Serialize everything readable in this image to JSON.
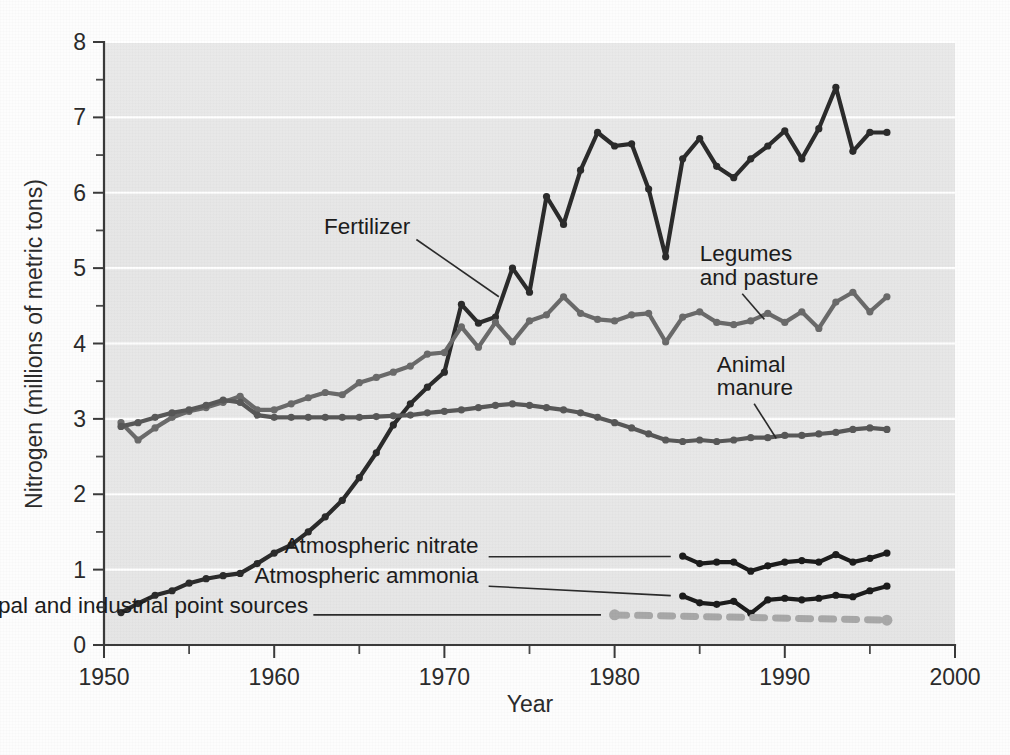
{
  "figure": {
    "background_color": "#fdfdfd",
    "plot_background_color": "#e7e7e7",
    "gridline_color": "#ffffff",
    "axis_color": "#3a3a3a"
  },
  "chart_data": {
    "type": "line",
    "title": "",
    "xlabel": "Year",
    "ylabel": "Nitrogen (millions of metric tons)",
    "xlim": [
      1950,
      2000
    ],
    "ylim": [
      0,
      8
    ],
    "x_major_ticks": [
      1950,
      1960,
      1970,
      1980,
      1990,
      2000
    ],
    "x_major_tick_labels": [
      "1950",
      "1960",
      "1970",
      "1980",
      "1990",
      "2000"
    ],
    "x_minor_ticks": [
      1955,
      1965,
      1975,
      1985,
      1995
    ],
    "y_major_ticks": [
      0,
      1,
      2,
      3,
      4,
      5,
      6,
      7,
      8
    ],
    "y_major_tick_labels": [
      "0",
      "1",
      "2",
      "3",
      "4",
      "5",
      "6",
      "7",
      "8"
    ],
    "y_minor_ticks": [
      0.5,
      1.5,
      2.5,
      3.5,
      4.5,
      5.5,
      6.5,
      7.5
    ],
    "grid": "horizontal-major-white",
    "legend_position": "inline-annotations",
    "series": [
      {
        "name": "Fertilizer",
        "color": "#2b2b2b",
        "style": "solid",
        "marker": "circle",
        "x": [
          1951,
          1952,
          1953,
          1954,
          1955,
          1956,
          1957,
          1958,
          1959,
          1960,
          1961,
          1962,
          1963,
          1964,
          1965,
          1966,
          1967,
          1968,
          1969,
          1970,
          1971,
          1972,
          1973,
          1974,
          1975,
          1976,
          1977,
          1978,
          1979,
          1980,
          1981,
          1982,
          1983,
          1984,
          1985,
          1986,
          1987,
          1988,
          1989,
          1990,
          1991,
          1992,
          1993,
          1994,
          1995,
          1996
        ],
        "values": [
          0.43,
          0.55,
          0.66,
          0.72,
          0.82,
          0.88,
          0.92,
          0.95,
          1.08,
          1.22,
          1.33,
          1.5,
          1.7,
          1.92,
          2.22,
          2.55,
          2.92,
          3.2,
          3.42,
          3.62,
          4.52,
          4.27,
          4.35,
          5.0,
          4.68,
          5.95,
          5.58,
          6.3,
          6.8,
          6.62,
          6.65,
          6.05,
          5.15,
          6.45,
          6.72,
          6.35,
          6.2,
          6.45,
          6.62,
          6.82,
          6.45,
          6.85,
          7.4,
          6.55,
          6.8,
          6.8
        ]
      },
      {
        "name": "Legumes and pasture",
        "color": "#6a6a6a",
        "style": "solid",
        "marker": "circle",
        "x": [
          1951,
          1952,
          1953,
          1954,
          1955,
          1956,
          1957,
          1958,
          1959,
          1960,
          1961,
          1962,
          1963,
          1964,
          1965,
          1966,
          1967,
          1968,
          1969,
          1970,
          1971,
          1972,
          1973,
          1974,
          1975,
          1976,
          1977,
          1978,
          1979,
          1980,
          1981,
          1982,
          1983,
          1984,
          1985,
          1986,
          1987,
          1988,
          1989,
          1990,
          1991,
          1992,
          1993,
          1994,
          1995,
          1996
        ],
        "values": [
          2.95,
          2.72,
          2.88,
          3.02,
          3.1,
          3.15,
          3.22,
          3.3,
          3.12,
          3.12,
          3.2,
          3.28,
          3.35,
          3.32,
          3.48,
          3.55,
          3.62,
          3.7,
          3.86,
          3.88,
          4.22,
          3.95,
          4.28,
          4.02,
          4.3,
          4.38,
          4.62,
          4.4,
          4.32,
          4.3,
          4.38,
          4.4,
          4.02,
          4.35,
          4.42,
          4.28,
          4.25,
          4.3,
          4.4,
          4.28,
          4.42,
          4.2,
          4.55,
          4.68,
          4.42,
          4.62
        ]
      },
      {
        "name": "Animal manure",
        "color": "#585858",
        "style": "solid",
        "marker": "circle",
        "x": [
          1951,
          1952,
          1953,
          1954,
          1955,
          1956,
          1957,
          1958,
          1959,
          1960,
          1961,
          1962,
          1963,
          1964,
          1965,
          1966,
          1967,
          1968,
          1969,
          1970,
          1971,
          1972,
          1973,
          1974,
          1975,
          1976,
          1977,
          1978,
          1979,
          1980,
          1981,
          1982,
          1983,
          1984,
          1985,
          1986,
          1987,
          1988,
          1989,
          1990,
          1991,
          1992,
          1993,
          1994,
          1995,
          1996
        ],
        "values": [
          2.9,
          2.95,
          3.02,
          3.08,
          3.12,
          3.18,
          3.25,
          3.22,
          3.05,
          3.02,
          3.02,
          3.02,
          3.02,
          3.02,
          3.02,
          3.03,
          3.04,
          3.05,
          3.08,
          3.1,
          3.12,
          3.15,
          3.18,
          3.2,
          3.18,
          3.15,
          3.12,
          3.08,
          3.02,
          2.95,
          2.88,
          2.8,
          2.72,
          2.7,
          2.72,
          2.7,
          2.72,
          2.75,
          2.75,
          2.78,
          2.78,
          2.8,
          2.82,
          2.86,
          2.88,
          2.86
        ]
      },
      {
        "name": "Atmospheric nitrate",
        "color": "#1c1c1c",
        "style": "solid",
        "marker": "circle",
        "x": [
          1984,
          1985,
          1986,
          1987,
          1988,
          1989,
          1990,
          1991,
          1992,
          1993,
          1994,
          1995,
          1996
        ],
        "values": [
          1.18,
          1.08,
          1.1,
          1.1,
          0.98,
          1.05,
          1.1,
          1.12,
          1.1,
          1.2,
          1.1,
          1.15,
          1.22
        ]
      },
      {
        "name": "Atmospheric ammonia",
        "color": "#1c1c1c",
        "style": "solid",
        "marker": "circle",
        "x": [
          1984,
          1985,
          1986,
          1987,
          1988,
          1989,
          1990,
          1991,
          1992,
          1993,
          1994,
          1995,
          1996
        ],
        "values": [
          0.65,
          0.56,
          0.54,
          0.58,
          0.42,
          0.6,
          0.62,
          0.6,
          0.62,
          0.66,
          0.64,
          0.72,
          0.78
        ]
      },
      {
        "name": "Municipal and industrial point sources",
        "color": "#a8a8a8",
        "style": "dashed",
        "marker": "circle",
        "x": [
          1980,
          1996
        ],
        "values": [
          0.4,
          0.33
        ]
      }
    ],
    "annotations": [
      {
        "text": "Fertilizer",
        "x": 1968,
        "y": 5.45
      },
      {
        "text": "Legumes",
        "x": 1985,
        "y": 5.1
      },
      {
        "text": "and pasture",
        "x": 1985,
        "y": 4.78
      },
      {
        "text": "Animal",
        "x": 1986,
        "y": 3.62
      },
      {
        "text": "manure",
        "x": 1986,
        "y": 3.32
      },
      {
        "text": "Atmospheric nitrate",
        "x": 1972,
        "y": 1.22
      },
      {
        "text": "Atmospheric ammonia",
        "x": 1972,
        "y": 0.82
      },
      {
        "text": "Municipal and industrial point sources",
        "x": 1962,
        "y": 0.43
      }
    ]
  }
}
